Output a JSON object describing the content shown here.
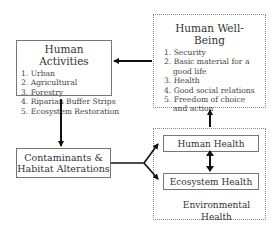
{
  "human_activities": {
    "title": "Human Activities",
    "items": [
      "1. Urban",
      "2. Agricultural",
      "3. Forestry",
      "4. Riparian Buffer Strips",
      "5. Ecosystem Restoration"
    ]
  },
  "human_well_being": {
    "title": "Human Well-Being",
    "items": [
      "1. Security",
      "2. Basic material for a",
      "good life",
      "3. Health",
      "4. Good social relations",
      "5. Freedom of choice",
      "and action"
    ]
  },
  "contaminants": {
    "line1": "Contaminants &",
    "line2": "Habitat Alterations"
  },
  "environmental_health": {
    "label": "Environmental Health",
    "human_health": "Human Health",
    "ecosystem_health": "Ecosystem Health"
  }
}
